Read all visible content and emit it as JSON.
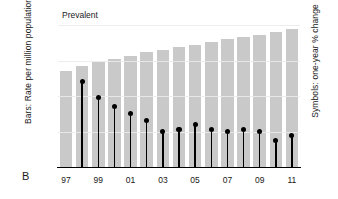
{
  "panel": {
    "label": "B"
  },
  "chart_data": {
    "type": "bar",
    "title": "Prevalent",
    "xlabel": "",
    "ylabel": "Bars: Rate per million population",
    "y2label": "Symbols: one-year % change",
    "categories": [
      "97",
      "98",
      "99",
      "00",
      "01",
      "02",
      "03",
      "04",
      "05",
      "06",
      "07",
      "08",
      "09",
      "10",
      "11"
    ],
    "tick_labels_x": [
      "97",
      "99",
      "01",
      "03",
      "05",
      "07",
      "09",
      "11"
    ],
    "ylim": [
      0,
      2000
    ],
    "yticks": [
      0,
      500,
      1000,
      1500,
      2000
    ],
    "ytick_labels": [
      "0",
      "500",
      "1,000",
      "1,500",
      "2,000"
    ],
    "y2lim": [
      0,
      8
    ],
    "y2ticks": [
      0,
      2,
      4,
      6,
      8
    ],
    "y2tick_labels": [
      "0",
      "2",
      "4",
      "6",
      "8"
    ],
    "grid": true,
    "legend": "none",
    "series": [
      {
        "name": "Bars: Rate per million population",
        "type": "bar",
        "axis": "left",
        "color": "#c9c9c9",
        "values": [
          1350,
          1420,
          1480,
          1525,
          1570,
          1620,
          1655,
          1685,
          1725,
          1760,
          1800,
          1825,
          1860,
          1905,
          1940
        ]
      },
      {
        "name": "Symbols: one-year % change",
        "type": "scatter-stem",
        "axis": "right",
        "color": "#000000",
        "values": [
          null,
          4.8,
          3.9,
          3.4,
          3.0,
          2.6,
          2.0,
          2.1,
          2.4,
          2.1,
          2.0,
          2.1,
          2.0,
          1.5,
          1.8
        ]
      }
    ]
  }
}
